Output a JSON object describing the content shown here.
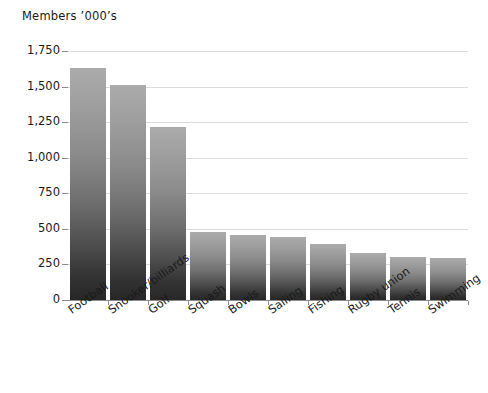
{
  "chart_data": {
    "type": "bar",
    "title": "Members ’000’s",
    "xlabel": "",
    "ylabel": "",
    "ylim": [
      0,
      1750
    ],
    "grid": true,
    "legend": false,
    "categories": [
      "Football",
      "Snooker/billiards",
      "Golf",
      "Squash",
      "Bowls",
      "Sailing",
      "Fishing",
      "Rugby union",
      "Tennis",
      "Swimming"
    ],
    "values": [
      1630,
      1510,
      1215,
      480,
      460,
      440,
      395,
      330,
      305,
      295
    ],
    "ytick_labels": [
      "0",
      "250",
      "500",
      "750",
      "1,000",
      "1,250",
      "1,500",
      "1,750"
    ],
    "ytick_values": [
      0,
      250,
      500,
      750,
      1000,
      1250,
      1500,
      1750
    ],
    "bar_color_top": "#ababab",
    "bar_color_bottom": "#272727",
    "gridline_color": "#dcdcdc",
    "axis_color": "#8c8c8c",
    "text_color": "#1a1a1a"
  }
}
